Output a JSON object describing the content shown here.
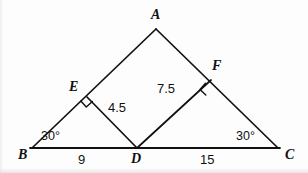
{
  "figure": {
    "kind": "euclidean-geometry-diagram",
    "background_color": "#fdfdfd",
    "stroke_color": "#111111",
    "text_color": "#111111"
  },
  "points": {
    "A": {
      "label": "A",
      "x": 156,
      "y": 29,
      "label_x": 151,
      "label_y": 8
    },
    "B": {
      "label": "B",
      "x": 32,
      "y": 148,
      "label_x": 18,
      "label_y": 148
    },
    "C": {
      "label": "C",
      "x": 278,
      "y": 148,
      "label_x": 285,
      "label_y": 148
    },
    "D": {
      "label": "D",
      "x": 137,
      "y": 148,
      "label_x": 131,
      "label_y": 156
    },
    "E": {
      "label": "E",
      "x": 87,
      "y": 97,
      "label_x": 69,
      "label_y": 80
    },
    "F": {
      "label": "F",
      "x": 211,
      "y": 80,
      "label_x": 212,
      "label_y": 59
    }
  },
  "segments": [
    {
      "name": "side-AB",
      "from": "B",
      "to": "A"
    },
    {
      "name": "side-AC",
      "from": "A",
      "to": "C"
    },
    {
      "name": "base-BC",
      "from": "B",
      "to": "C"
    },
    {
      "name": "segment-ED",
      "from": "E",
      "to": "D"
    },
    {
      "name": "segment-DF",
      "from": "D",
      "to": "F"
    }
  ],
  "right_angle_marks": [
    {
      "name": "right-angle-at-E",
      "vertex": "E",
      "size": 8
    },
    {
      "name": "right-angle-at-F",
      "vertex": "F",
      "size": 8
    }
  ],
  "measures": {
    "ED": {
      "value": "4.5",
      "x": 108,
      "y": 101
    },
    "DF": {
      "value": "7.5",
      "x": 157,
      "y": 82
    },
    "BD": {
      "value": "9",
      "x": 78,
      "y": 153
    },
    "DC": {
      "value": "15",
      "x": 200,
      "y": 153
    }
  },
  "angles": {
    "B": {
      "value": "30°",
      "x": 41,
      "y": 130
    },
    "C": {
      "value": "30°",
      "x": 236,
      "y": 130
    }
  }
}
